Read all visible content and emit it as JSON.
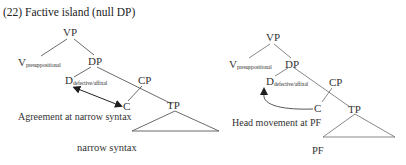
{
  "title": "(22) Factive island (null DP)",
  "left_tree": {
    "nodes": {
      "vp": "VP",
      "v_base": "V",
      "v_sub": "presuppositional",
      "dp": "DP",
      "d_base": "D",
      "d_sub": "defective/affixal",
      "cp": "CP",
      "c": "C",
      "tp": "TP"
    },
    "annotation": "Agreement at narrow syntax",
    "caption": "narrow syntax",
    "arrow_type": "double-headed straight arrow between D and C"
  },
  "right_tree": {
    "nodes": {
      "vp": "VP",
      "v_base": "V",
      "v_sub": "presuppositional",
      "dp": "DP",
      "d_base": "D",
      "d_sub": "defective/affixal",
      "cp": "CP",
      "c": "C",
      "tp": "TP"
    },
    "annotation": "Head movement at PF",
    "caption": "PF",
    "arrow_type": "curved arrow from C to D"
  },
  "colors": {
    "line": "#555555",
    "arrow": "#222222",
    "text": "#333333"
  }
}
